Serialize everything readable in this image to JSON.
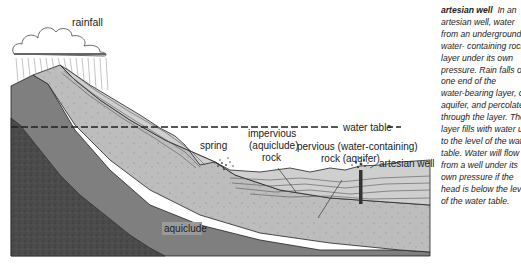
{
  "diagram": {
    "title": "artesian well",
    "labels": {
      "rainfall": "rainfall",
      "water_table": "water table",
      "spring": "spring",
      "impervious_line1": "impervious",
      "impervious_line2": "(aquiclude)",
      "impervious_line3": "rock",
      "pervious_line1": "pervious (water-containing)",
      "pervious_line2": "rock (aquifer)",
      "artesian_well": "artesian well",
      "aquiclude": "aquiclude"
    },
    "colors": {
      "background": "#ffffff",
      "aquiclude_dark": "#4a4a4a",
      "aquiclude_mid": "#7d7d7d",
      "aquifer_light": "#b9b9b9",
      "impervious_layer": "#cfcfcf",
      "outline": "#222222"
    }
  },
  "caption": {
    "term": "artesian well",
    "lines": [
      "In an",
      "artesian well, water",
      "from an underground",
      "water- containing rock",
      "layer under its own",
      "pressure. Rain falls on",
      "one end of the",
      "water-bearing layer, or",
      "aquifer, and percolates",
      "through the layer. The",
      "layer fills with water up",
      "to the level of the water",
      "table. Water will flow",
      "from a well under its",
      "own pressure if the",
      "head is below the level",
      "of the water table."
    ]
  }
}
